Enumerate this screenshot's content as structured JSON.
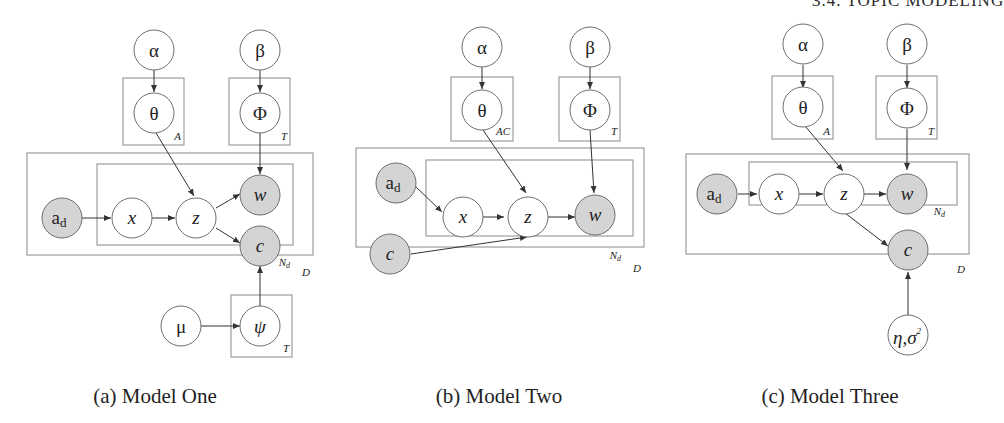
{
  "header": {
    "text": "3.4. TOPIC MODELING"
  },
  "figures": [
    {
      "caption": "(a) Model One",
      "nodes": {
        "alpha": "α",
        "beta": "β",
        "theta": "θ",
        "phi": "Φ",
        "ad": "a",
        "ad_sub": "d",
        "x": "x",
        "z": "z",
        "w": "w",
        "c": "c",
        "mu": "μ",
        "psi": "ψ"
      },
      "plates": {
        "theta": "A",
        "phi": "T",
        "inner": "N",
        "inner_sub": "d",
        "outer": "D",
        "psi": "T"
      }
    },
    {
      "caption": "(b) Model Two",
      "nodes": {
        "alpha": "α",
        "beta": "β",
        "theta": "θ",
        "phi": "Φ",
        "ad": "a",
        "ad_sub": "d",
        "x": "x",
        "z": "z",
        "w": "w",
        "c": "c"
      },
      "plates": {
        "theta": "AC",
        "phi": "T",
        "inner": "N",
        "inner_sub": "d",
        "outer": "D"
      }
    },
    {
      "caption": "(c) Model Three",
      "nodes": {
        "alpha": "α",
        "beta": "β",
        "theta": "θ",
        "phi": "Φ",
        "ad": "a",
        "ad_sub": "d",
        "x": "x",
        "z": "z",
        "w": "w",
        "c": "c",
        "eta_sigma": "η,σ",
        "eta_sigma_sup": "2"
      },
      "plates": {
        "theta": "A",
        "phi": "T",
        "inner": "N",
        "inner_sub": "d",
        "outer": "D"
      }
    }
  ],
  "colors": {
    "observed_fill": "#d4d4d4",
    "latent_fill": "#ffffff",
    "stroke": "#6e6e6e",
    "plate": "#8a8a8a"
  }
}
